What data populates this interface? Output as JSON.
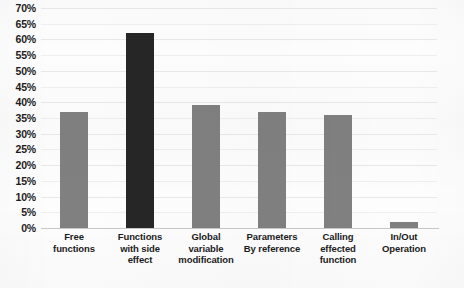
{
  "chart_data": {
    "type": "bar",
    "title": "",
    "subtitle": "",
    "xlabel": "",
    "ylabel": "",
    "ylim": [
      0,
      70
    ],
    "ytick_step": 5,
    "grid": true,
    "legend": "none",
    "categories": [
      "Free functions",
      "Functions with side effect",
      "Global variable modification",
      "Parameters By reference",
      "Calling effected function",
      "In/Out Operation"
    ],
    "category_lines": [
      [
        "Free",
        "functions"
      ],
      [
        "Functions",
        "with side",
        "effect"
      ],
      [
        "Global",
        "variable",
        "modification"
      ],
      [
        "Parameters",
        "By reference"
      ],
      [
        "Calling",
        "effected",
        "function"
      ],
      [
        "In/Out",
        "Operation"
      ]
    ],
    "values": [
      37,
      62,
      39,
      37,
      36,
      2
    ],
    "value_labels": [
      "37%",
      "62%",
      "39%",
      "37%",
      "36%",
      "2%"
    ],
    "bar_colors": [
      "#808080",
      "#262626",
      "#808080",
      "#808080",
      "#808080",
      "#808080"
    ],
    "ytick_labels": [
      "70%",
      "65%",
      "60%",
      "55%",
      "50%",
      "45%",
      "40%",
      "35%",
      "30%",
      "25%",
      "20%",
      "15%",
      "10%",
      "5%",
      "0%"
    ],
    "ytick_values": [
      70,
      65,
      60,
      55,
      50,
      45,
      40,
      35,
      30,
      25,
      20,
      15,
      10,
      5,
      0
    ]
  },
  "colors": {
    "bar_gray": "#808080",
    "bar_dark": "#262626",
    "gridline": "#e9e9e9",
    "axis_line": "#c8c8c8",
    "text": "#1c1c1c",
    "background": "#fdfdfd"
  }
}
